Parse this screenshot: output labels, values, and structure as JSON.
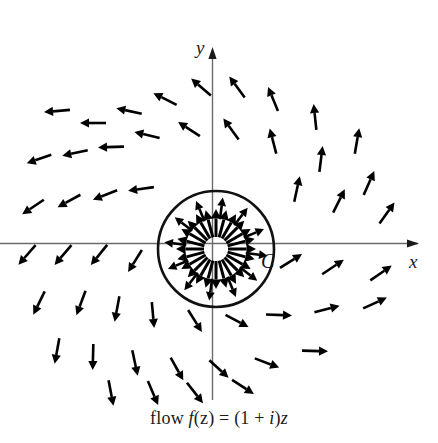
{
  "figure": {
    "caption": "flow f(z) = (1 + i)z",
    "caption_parts": {
      "word": "flow",
      "func": "f",
      "open_z": "(z)",
      "equals": "=",
      "expr_open": "(1 +",
      "imag": "i",
      "expr_close": ")",
      "var_z": "z"
    },
    "axis_x_label": "x",
    "axis_y_label": "y",
    "contour_label": "C",
    "colors": {
      "background": "#ffffff",
      "axis": "#6b6b6b",
      "arrow": "#000000",
      "contour": "#111111",
      "text": "#1a1a1a"
    }
  },
  "chart_data": {
    "type": "scatter",
    "subtitle": "",
    "xlabel": "x",
    "ylabel": "y",
    "grid": false,
    "legend": null,
    "annotations": [
      {
        "text": "C",
        "x": 0.78,
        "y": -0.22,
        "note": "label of the circular contour"
      },
      {
        "text": "x",
        "x": 3.45,
        "y": -0.18,
        "note": "horizontal axis label"
      },
      {
        "text": "y",
        "x": -0.18,
        "y": 3.3,
        "note": "vertical axis label"
      }
    ],
    "origin_px": {
      "x": 213,
      "y": 243
    },
    "scale_px_per_unit": 60,
    "xlim": [
      -3.55,
      3.75
    ],
    "ylim": [
      -2.62,
      3.25
    ],
    "contour": {
      "shape": "circle",
      "label": "C",
      "center": [
        0.05,
        0.1
      ],
      "radius_units": 0.96,
      "center_px": [
        216,
        249
      ],
      "radius_px": 58
    },
    "field": {
      "name": "f(z) = (1 + i)z",
      "description": "Complex linear flow; vector at point z has direction arg(z) + 45 degrees and magnitude sqrt(2)|z|. Inside contour C arrows are drawn radiating outward from the centre.",
      "rotation_deg": 45,
      "magnitude_factor": 1.4142,
      "outside_samples": [
        {
          "x": -2.6,
          "y": 2.2,
          "u": -4.8,
          "v": -0.4
        },
        {
          "x": -2.0,
          "y": 2.0,
          "u": -4.0,
          "v": 0.0
        },
        {
          "x": -1.4,
          "y": 2.2,
          "u": -3.6,
          "v": 0.8
        },
        {
          "x": -0.8,
          "y": 2.4,
          "u": -3.2,
          "v": 1.6
        },
        {
          "x": -0.2,
          "y": 2.6,
          "u": -2.8,
          "v": 2.4
        },
        {
          "x": 0.4,
          "y": 2.6,
          "u": -2.2,
          "v": 3.0
        },
        {
          "x": 1.0,
          "y": 2.4,
          "u": -1.4,
          "v": 3.4
        },
        {
          "x": 1.7,
          "y": 2.1,
          "u": -0.4,
          "v": 3.8
        },
        {
          "x": 2.4,
          "y": 1.7,
          "u": 0.7,
          "v": 4.1
        },
        {
          "x": -2.9,
          "y": 1.4,
          "u": -4.3,
          "v": -1.5
        },
        {
          "x": -2.3,
          "y": 1.5,
          "u": -3.8,
          "v": -0.8
        },
        {
          "x": -1.7,
          "y": 1.6,
          "u": -3.3,
          "v": -0.1
        },
        {
          "x": -1.1,
          "y": 1.8,
          "u": -2.9,
          "v": 0.7
        },
        {
          "x": -0.4,
          "y": 1.9,
          "u": -2.3,
          "v": 1.5
        },
        {
          "x": 0.3,
          "y": 1.9,
          "u": -1.6,
          "v": 2.2
        },
        {
          "x": 1.0,
          "y": 1.7,
          "u": -0.7,
          "v": 2.7
        },
        {
          "x": 1.8,
          "y": 1.4,
          "u": 0.4,
          "v": 3.2
        },
        {
          "x": 2.6,
          "y": 1.0,
          "u": 1.6,
          "v": 3.6
        },
        {
          "x": -3.0,
          "y": 0.6,
          "u": -3.6,
          "v": -2.4
        },
        {
          "x": -2.4,
          "y": 0.7,
          "u": -3.1,
          "v": -1.7
        },
        {
          "x": -1.8,
          "y": 0.8,
          "u": -2.6,
          "v": -1.0
        },
        {
          "x": -1.2,
          "y": 0.9,
          "u": -2.1,
          "v": -0.3
        },
        {
          "x": 1.4,
          "y": 0.9,
          "u": 0.5,
          "v": 2.3
        },
        {
          "x": 2.1,
          "y": 0.7,
          "u": 1.4,
          "v": 2.8
        },
        {
          "x": 2.9,
          "y": 0.5,
          "u": 2.4,
          "v": 3.4
        },
        {
          "x": -3.1,
          "y": -0.2,
          "u": -2.9,
          "v": -3.3
        },
        {
          "x": -2.5,
          "y": -0.2,
          "u": -2.3,
          "v": -2.7
        },
        {
          "x": -1.9,
          "y": -0.2,
          "u": -1.7,
          "v": -2.1
        },
        {
          "x": -1.3,
          "y": -0.3,
          "u": -1.0,
          "v": -1.6
        },
        {
          "x": 1.3,
          "y": -0.3,
          "u": 1.6,
          "v": 1.0
        },
        {
          "x": 2.0,
          "y": -0.4,
          "u": 2.4,
          "v": 1.6
        },
        {
          "x": 2.8,
          "y": -0.5,
          "u": 3.3,
          "v": 2.3
        },
        {
          "x": -2.9,
          "y": -1.0,
          "u": -1.9,
          "v": -3.9
        },
        {
          "x": -2.2,
          "y": -1.0,
          "u": -1.2,
          "v": -3.2
        },
        {
          "x": -1.6,
          "y": -1.1,
          "u": -0.5,
          "v": -2.7
        },
        {
          "x": -1.0,
          "y": -1.2,
          "u": 0.2,
          "v": -2.2
        },
        {
          "x": -0.3,
          "y": -1.3,
          "u": 1.0,
          "v": -1.6
        },
        {
          "x": 0.4,
          "y": -1.3,
          "u": 1.7,
          "v": -0.9
        },
        {
          "x": 1.1,
          "y": -1.2,
          "u": 2.3,
          "v": -0.1
        },
        {
          "x": 1.9,
          "y": -1.1,
          "u": 3.0,
          "v": 0.8
        },
        {
          "x": 2.7,
          "y": -1.0,
          "u": 3.7,
          "v": 1.7
        },
        {
          "x": -2.6,
          "y": -1.8,
          "u": -0.8,
          "v": -4.4
        },
        {
          "x": -2.0,
          "y": -1.9,
          "u": -0.1,
          "v": -3.9
        },
        {
          "x": -1.3,
          "y": -2.0,
          "u": 0.7,
          "v": -3.3
        },
        {
          "x": -0.6,
          "y": -2.1,
          "u": 1.5,
          "v": -2.7
        },
        {
          "x": 0.1,
          "y": -2.1,
          "u": 2.2,
          "v": -2.0
        },
        {
          "x": 0.9,
          "y": -2.0,
          "u": 2.9,
          "v": -1.1
        },
        {
          "x": 1.7,
          "y": -1.8,
          "u": 3.5,
          "v": -0.1
        },
        {
          "x": -1.7,
          "y": -2.5,
          "u": 0.8,
          "v": -4.2
        },
        {
          "x": -1.0,
          "y": -2.5,
          "u": 1.5,
          "v": -3.5
        },
        {
          "x": -0.3,
          "y": -2.5,
          "u": 2.2,
          "v": -2.8
        },
        {
          "x": 0.5,
          "y": -2.4,
          "u": 2.9,
          "v": -1.9
        }
      ],
      "inside_description": "24 arrows radiating outward from the contour centre at 15-degree spacing, two concentric rings"
    }
  }
}
